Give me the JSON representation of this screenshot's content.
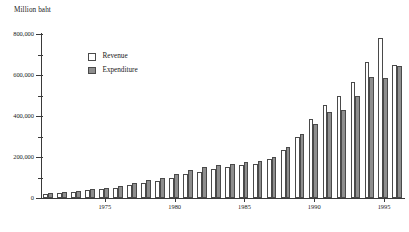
{
  "chart_data": {
    "type": "bar",
    "title": "",
    "ylabel": "Million baht",
    "xlabel": "",
    "ylim": [
      0,
      800000
    ],
    "yticks": [
      0,
      200000,
      400000,
      600000,
      800000
    ],
    "ytick_labels": [
      "0",
      "200,000",
      "400,000",
      "600,000",
      "800,000"
    ],
    "yminor_ticks": [
      100000,
      300000,
      500000,
      700000
    ],
    "grid": false,
    "legend_position": "upper-left-inside",
    "categories": [
      1971,
      1972,
      1973,
      1974,
      1975,
      1976,
      1977,
      1978,
      1979,
      1980,
      1981,
      1982,
      1983,
      1984,
      1985,
      1986,
      1987,
      1988,
      1989,
      1990,
      1991,
      1992,
      1993,
      1994,
      1995,
      1996
    ],
    "xtick_labels": [
      "1975",
      "1980",
      "1985",
      "1990",
      "1995"
    ],
    "xtick_values": [
      1975,
      1980,
      1985,
      1990,
      1995
    ],
    "series": [
      {
        "name": "Revenue",
        "color": "#ffffff",
        "values": [
          22000,
          25000,
          30000,
          38000,
          44000,
          50000,
          62000,
          72000,
          85000,
          97000,
          115000,
          125000,
          140000,
          150000,
          160000,
          165000,
          190000,
          235000,
          300000,
          385000,
          455000,
          500000,
          565000,
          665000,
          780000,
          650000
        ]
      },
      {
        "name": "Expenditure",
        "color": "#8e8e8e",
        "values": [
          25000,
          29000,
          34000,
          42000,
          50000,
          60000,
          72000,
          88000,
          100000,
          115000,
          135000,
          150000,
          160000,
          165000,
          175000,
          180000,
          200000,
          250000,
          310000,
          360000,
          420000,
          430000,
          500000,
          590000,
          585000,
          645000
        ]
      }
    ]
  }
}
